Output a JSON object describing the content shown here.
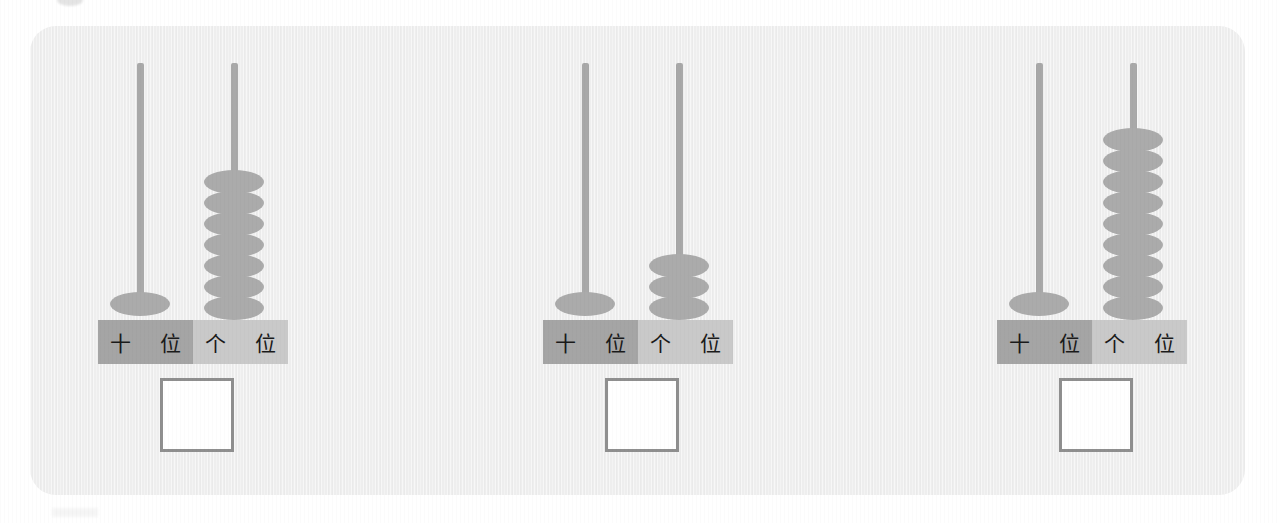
{
  "page": {
    "background_color": "#ffffff",
    "panel_color": "#eeeeee"
  },
  "colors": {
    "rod": "#a9a9a9",
    "bead": "#ababab",
    "tens_cell": "#a5a5a5",
    "ones_cell": "#c9c9c9",
    "answer_box_border": "#8f8f8f",
    "answer_box_fill": "#ffffff"
  },
  "labels": {
    "tens": "十 位",
    "ones": "个 位"
  },
  "groups": [
    {
      "id": "abacus-1",
      "tens_beads": 1,
      "ones_beads": 7,
      "answer": ""
    },
    {
      "id": "abacus-2",
      "tens_beads": 1,
      "ones_beads": 3,
      "answer": ""
    },
    {
      "id": "abacus-3",
      "tens_beads": 1,
      "ones_beads": 9,
      "answer": ""
    }
  ]
}
